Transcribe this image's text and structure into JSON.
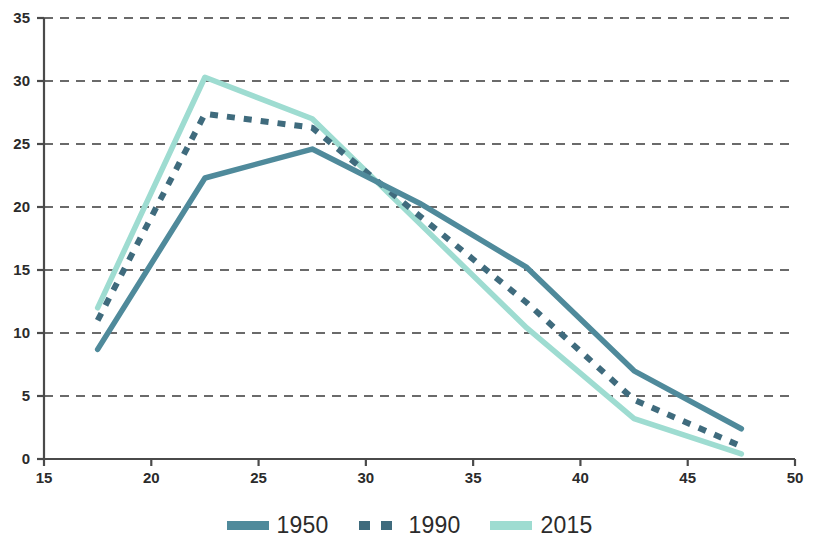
{
  "chart_data": {
    "type": "line",
    "title": "",
    "subtitle": "",
    "xlabel": "",
    "ylabel": "",
    "xlim": [
      15,
      50
    ],
    "ylim": [
      0,
      35
    ],
    "xticks": [
      15,
      20,
      25,
      30,
      35,
      40,
      45,
      50
    ],
    "yticks": [
      0,
      5,
      10,
      15,
      20,
      25,
      30,
      35
    ],
    "grid": "horizontal-dashed",
    "legend_position": "bottom-center",
    "x": [
      17.5,
      22.5,
      27.5,
      32.5,
      37.5,
      42.5,
      47.5
    ],
    "series": [
      {
        "name": "1950",
        "color": "#4f8a9b",
        "style": "solid",
        "values": [
          8.7,
          22.3,
          24.6,
          20.3,
          15.2,
          7.0,
          2.4
        ]
      },
      {
        "name": "1990",
        "color": "#3f6b7d",
        "style": "dashed",
        "values": [
          11.0,
          27.4,
          26.3,
          19.3,
          12.4,
          4.7,
          1.0
        ]
      },
      {
        "name": "2015",
        "color": "#9edcd1",
        "style": "solid",
        "values": [
          12.0,
          30.3,
          27.0,
          18.7,
          10.4,
          3.2,
          0.4
        ]
      }
    ]
  },
  "axes": {
    "y_tick_labels": [
      "35",
      "30",
      "25",
      "20",
      "15",
      "10",
      "5",
      "0"
    ],
    "x_tick_labels": [
      "15",
      "20",
      "25",
      "30",
      "35",
      "40",
      "45",
      "50"
    ]
  },
  "legend": {
    "items": [
      {
        "label": "1950",
        "color": "#4f8a9b",
        "style": "solid"
      },
      {
        "label": "1990",
        "color": "#3f6b7d",
        "style": "dashed"
      },
      {
        "label": "2015",
        "color": "#9edcd1",
        "style": "solid"
      }
    ]
  },
  "colors": {
    "axis": "#4a4a4a",
    "grid": "#3a3a3a",
    "text": "#2b2b2b",
    "background": "#ffffff"
  }
}
